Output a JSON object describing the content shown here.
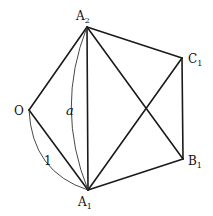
{
  "diagram": {
    "points": {
      "O": {
        "label": "O",
        "sub": "",
        "x": 29,
        "y": 110
      },
      "A1": {
        "label": "A",
        "sub": "1",
        "x": 88,
        "y": 190
      },
      "A2": {
        "label": "A",
        "sub": "2",
        "x": 87,
        "y": 27
      },
      "B1": {
        "label": "B",
        "sub": "1",
        "x": 183,
        "y": 159
      },
      "C1": {
        "label": "C",
        "sub": "1",
        "x": 182,
        "y": 58
      }
    },
    "edges": [
      [
        "O",
        "A2"
      ],
      [
        "O",
        "A1"
      ],
      [
        "A2",
        "A1"
      ],
      [
        "A2",
        "C1"
      ],
      [
        "A2",
        "B1"
      ],
      [
        "A1",
        "C1"
      ],
      [
        "A1",
        "B1"
      ],
      [
        "C1",
        "B1"
      ]
    ],
    "arcs": [
      {
        "from": "O",
        "to": "A1",
        "label": "1"
      },
      {
        "from": "A2",
        "to": "A1",
        "label": "a"
      }
    ],
    "labels": {
      "O": "O",
      "A1_main": "A",
      "A1_sub": "1",
      "A2_main": "A",
      "A2_sub": "2",
      "B1_main": "B",
      "B1_sub": "1",
      "C1_main": "C",
      "C1_sub": "1",
      "arc_one": "1",
      "arc_a": "a"
    }
  }
}
